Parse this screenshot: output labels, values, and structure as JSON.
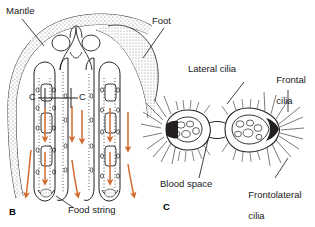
{
  "figure": {
    "title_text": "",
    "background": "#ffffff",
    "ink_color": "#231f20",
    "arrow_color": "#d2692e",
    "stipple_color": "#6e6a68"
  },
  "panels": [
    {
      "id": "B",
      "label": "B",
      "x": 10,
      "y": 208,
      "description": "Longitudinal section of bivalve gill and mantle showing water and food flow"
    },
    {
      "id": "C",
      "label": "C",
      "x": 163,
      "y": 205,
      "description": "Cross-section of two gill filaments showing ciliary tracts and blood space"
    }
  ],
  "labels": [
    {
      "name": "mantle",
      "text": "Mantle",
      "x": 6,
      "y": 6,
      "lines": [
        "Mantle"
      ]
    },
    {
      "name": "foot",
      "text": "Foot",
      "x": 152,
      "y": 16,
      "lines": [
        "Foot"
      ]
    },
    {
      "name": "food-string",
      "text": "Food string",
      "x": 68,
      "y": 210,
      "lines": [
        "Food string"
      ]
    },
    {
      "name": "lateral-cilia",
      "text": "Lateral cilia",
      "x": 188,
      "y": 67,
      "lines": [
        "Lateral cilia"
      ]
    },
    {
      "name": "frontal-cilia",
      "text": "Frontal cilia",
      "x": 271,
      "y": 67,
      "lines": [
        "Frontal",
        "cilia"
      ]
    },
    {
      "name": "blood-space",
      "text": "Blood space",
      "x": 163,
      "y": 182,
      "lines": [
        "Blood space"
      ]
    },
    {
      "name": "frontolateral-cilia",
      "text": "Frontolateral cilia",
      "x": 245,
      "y": 182,
      "lines": [
        "Frontolateral",
        "cilia"
      ]
    }
  ],
  "section_markers": [
    {
      "name": "section-marker-left",
      "text": "C",
      "x": 30,
      "y": 93
    },
    {
      "name": "section-marker-right",
      "text": "C",
      "x": 79,
      "y": 93
    }
  ],
  "flow_arrows": {
    "count": 10,
    "color": "#d2692e",
    "direction": "downward-then-outward",
    "meaning": "water and mucus-food current through gill lamellae"
  },
  "structures": [
    {
      "name": "mantle-band",
      "type": "stippled-curve"
    },
    {
      "name": "foot-mass",
      "type": "stippled-wedge"
    },
    {
      "name": "gill-demibranch-left",
      "type": "lamella-pair"
    },
    {
      "name": "gill-demibranch-right",
      "type": "lamella-pair"
    },
    {
      "name": "food-groove",
      "type": "v-notch"
    },
    {
      "name": "filament-left",
      "type": "cross-section"
    },
    {
      "name": "filament-right",
      "type": "cross-section"
    },
    {
      "name": "interfilament-junction",
      "type": "isthmus"
    }
  ]
}
